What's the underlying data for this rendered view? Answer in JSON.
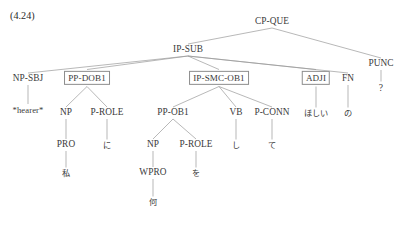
{
  "figure": {
    "example_number": "(4.24)",
    "line_color": "#9a9a9a",
    "box_border_color": "#8d8d8d",
    "text_color": "#3a3a3a"
  },
  "tree": {
    "type": "constituency-parse-tree",
    "nodes": {
      "cp_que": {
        "label": "CP-QUE",
        "x": 272,
        "y": 22,
        "boxed": false
      },
      "ip_sub": {
        "label": "IP-SUB",
        "x": 188,
        "y": 50,
        "boxed": false
      },
      "punc": {
        "label": "PUNC",
        "x": 381,
        "y": 64,
        "boxed": false
      },
      "punc_term": {
        "label": "?",
        "x": 381,
        "y": 88,
        "boxed": false
      },
      "np_sbj": {
        "label": "NP-SBJ",
        "x": 28,
        "y": 79,
        "boxed": false
      },
      "hearer": {
        "label": "*hearer*",
        "x": 28,
        "y": 110,
        "boxed": false
      },
      "pp_dob1": {
        "label": "PP-DOB1",
        "x": 87,
        "y": 78,
        "boxed": true
      },
      "np_1": {
        "label": "NP",
        "x": 66,
        "y": 113,
        "boxed": false
      },
      "p_role_1": {
        "label": "P-ROLE",
        "x": 107,
        "y": 113,
        "boxed": false
      },
      "pro": {
        "label": "PRO",
        "x": 66,
        "y": 145,
        "boxed": false
      },
      "watashi": {
        "label": "私",
        "x": 66,
        "y": 173,
        "boxed": false
      },
      "ni": {
        "label": "に",
        "x": 107,
        "y": 145,
        "boxed": false
      },
      "ip_smc_ob1": {
        "label": "IP-SMC-OB1",
        "x": 219,
        "y": 78,
        "boxed": true
      },
      "pp_ob1": {
        "label": "PP-OB1",
        "x": 173,
        "y": 113,
        "boxed": false
      },
      "np_2": {
        "label": "NP",
        "x": 153,
        "y": 145,
        "boxed": false
      },
      "p_role_2": {
        "label": "P-ROLE",
        "x": 196,
        "y": 145,
        "boxed": false
      },
      "wpro": {
        "label": "WPRO",
        "x": 153,
        "y": 173,
        "boxed": false
      },
      "nani": {
        "label": "何",
        "x": 153,
        "y": 202,
        "boxed": false
      },
      "wo": {
        "label": "を",
        "x": 196,
        "y": 173,
        "boxed": false
      },
      "vb": {
        "label": "VB",
        "x": 236,
        "y": 113,
        "boxed": false
      },
      "shi": {
        "label": "し",
        "x": 236,
        "y": 145,
        "boxed": false
      },
      "p_conn": {
        "label": "P-CONN",
        "x": 272,
        "y": 113,
        "boxed": false
      },
      "te": {
        "label": "て",
        "x": 272,
        "y": 145,
        "boxed": false
      },
      "adji": {
        "label": "ADJI",
        "x": 316,
        "y": 78,
        "boxed": true
      },
      "hoshii": {
        "label": "ほしい",
        "x": 316,
        "y": 113,
        "boxed": false
      },
      "fn": {
        "label": "FN",
        "x": 348,
        "y": 79,
        "boxed": false
      },
      "no": {
        "label": "の",
        "x": 348,
        "y": 113,
        "boxed": false
      }
    },
    "edges": [
      [
        "cp_que",
        "ip_sub"
      ],
      [
        "cp_que",
        "punc"
      ],
      [
        "punc",
        "punc_term"
      ],
      [
        "ip_sub",
        "np_sbj"
      ],
      [
        "ip_sub",
        "pp_dob1"
      ],
      [
        "ip_sub",
        "ip_smc_ob1"
      ],
      [
        "ip_sub",
        "adji"
      ],
      [
        "ip_sub",
        "fn"
      ],
      [
        "np_sbj",
        "hearer"
      ],
      [
        "pp_dob1",
        "np_1"
      ],
      [
        "pp_dob1",
        "p_role_1"
      ],
      [
        "np_1",
        "pro"
      ],
      [
        "pro",
        "watashi"
      ],
      [
        "p_role_1",
        "ni"
      ],
      [
        "ip_smc_ob1",
        "pp_ob1"
      ],
      [
        "ip_smc_ob1",
        "vb"
      ],
      [
        "ip_smc_ob1",
        "p_conn"
      ],
      [
        "pp_ob1",
        "np_2"
      ],
      [
        "pp_ob1",
        "p_role_2"
      ],
      [
        "np_2",
        "wpro"
      ],
      [
        "wpro",
        "nani"
      ],
      [
        "p_role_2",
        "wo"
      ],
      [
        "vb",
        "shi"
      ],
      [
        "p_conn",
        "te"
      ],
      [
        "adji",
        "hoshii"
      ],
      [
        "fn",
        "no"
      ]
    ]
  }
}
